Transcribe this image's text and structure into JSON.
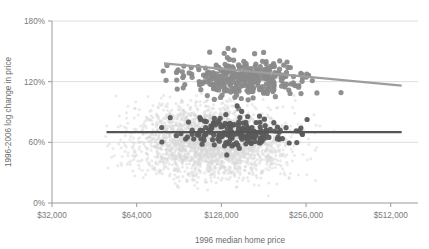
{
  "chart_data": {
    "type": "scatter",
    "title": "",
    "subtitle": "",
    "xlabel": "1996 median home price",
    "ylabel": "1996-2006 log change in price",
    "x_scale": "log2",
    "xlim": [
      32000,
      640000
    ],
    "ylim": [
      0,
      180
    ],
    "y_unit": "%",
    "grid": "horizontal",
    "legend_position": "none",
    "xticks": [
      {
        "value": 32000,
        "label": "$32,000"
      },
      {
        "value": 64000,
        "label": "$64,000"
      },
      {
        "value": 128000,
        "label": "$128,000"
      },
      {
        "value": 256000,
        "label": "$256,000"
      },
      {
        "value": 512000,
        "label": "$512,000"
      }
    ],
    "yticks": [
      {
        "value": 0,
        "label": "0%"
      },
      {
        "value": 60,
        "label": "60%"
      },
      {
        "value": 120,
        "label": "120%"
      },
      {
        "value": 180,
        "label": "180%"
      }
    ],
    "series": [
      {
        "name": "background-all-metros",
        "color": "#d8d8d8",
        "marker": "circle",
        "marker_radius": 1.5,
        "opacity": 0.55,
        "point_count": 2400,
        "x_center_log2": 16.85,
        "x_spread_log2": 0.78,
        "y_center": 62,
        "y_spread": 30,
        "note": "dense light-gray cloud of all observations"
      },
      {
        "name": "highlighted-high-growth",
        "color": "#8a8a8a",
        "marker": "circle",
        "marker_radius": 2.6,
        "opacity": 0.95,
        "point_count": 330,
        "x_center_log2": 17.25,
        "x_spread_log2": 0.62,
        "y_center": 123,
        "y_spread": 17,
        "note": "medium-gray cluster centered near 120% log change"
      },
      {
        "name": "highlighted-low-growth",
        "color": "#5a5a5a",
        "marker": "circle",
        "marker_radius": 2.6,
        "opacity": 0.95,
        "point_count": 175,
        "x_center_log2": 17.15,
        "x_spread_log2": 0.58,
        "y_center": 70,
        "y_spread": 14,
        "note": "dark-gray cluster centered near 70% log change"
      }
    ],
    "trendlines": [
      {
        "name": "high-growth-trend",
        "color": "#9d9d9d",
        "width": 2.2,
        "x_start": 80000,
        "x_end": 560000,
        "y_start": 138,
        "y_end": 116,
        "slope_direction": "down"
      },
      {
        "name": "low-growth-trend",
        "color": "#555555",
        "width": 2.2,
        "x_start": 50000,
        "x_end": 560000,
        "y_start": 70,
        "y_end": 70,
        "slope_direction": "flat"
      }
    ]
  },
  "axes": {
    "y_title": "1996-2006 log change in price",
    "x_title": "1996 median home price"
  },
  "colors": {
    "background_points": "#d8d8d8",
    "mid_points": "#8a8a8a",
    "dark_points": "#5a5a5a",
    "gridline": "#cfcfcf",
    "axis": "#9a9a9a",
    "text": "#7a7a7a",
    "page_background": "#ffffff"
  }
}
